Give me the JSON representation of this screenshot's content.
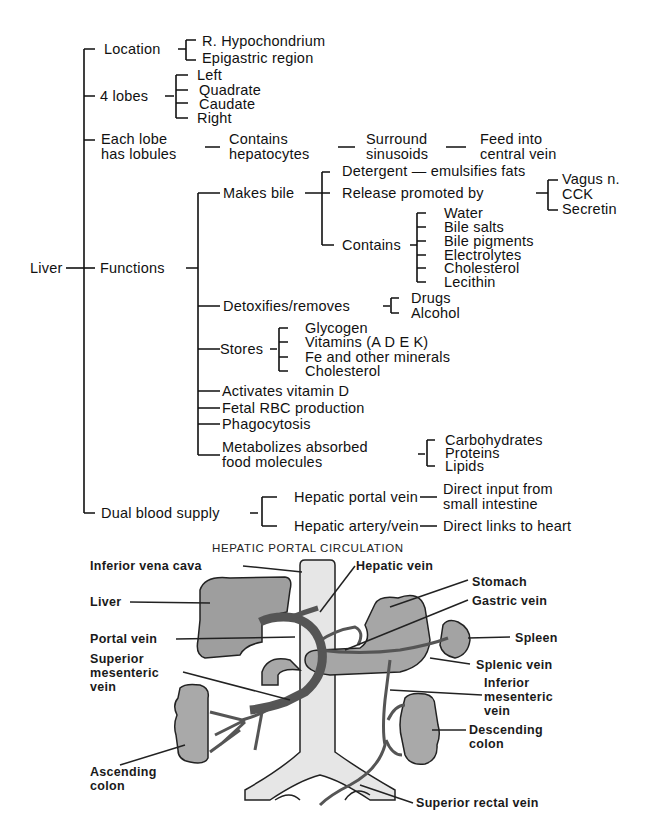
{
  "concept_map": {
    "root": "Liver",
    "branches": {
      "location": {
        "label": "Location",
        "children": [
          "R. Hypochondrium",
          "Epigastric region"
        ]
      },
      "lobes": {
        "label": "4 lobes",
        "children": [
          "Left",
          "Quadrate",
          "Caudate",
          "Right"
        ]
      },
      "lobules": {
        "label_line1": "Each lobe",
        "label_line2": "has lobules",
        "chain": [
          {
            "line1": "Contains",
            "line2": "hepatocytes"
          },
          {
            "line1": "Surround",
            "line2": "sinusoids"
          },
          {
            "line1": "Feed into",
            "line2": "central vein"
          }
        ]
      },
      "functions": {
        "label": "Functions",
        "makes_bile": {
          "label": "Makes bile",
          "detergent": "Detergent — emulsifies fats",
          "release": {
            "label": "Release promoted by",
            "children": [
              "Vagus n.",
              "CCK",
              "Secretin"
            ]
          },
          "contains": {
            "label": "Contains",
            "children": [
              "Water",
              "Bile salts",
              "Bile pigments",
              "Electrolytes",
              "Cholesterol",
              "Lecithin"
            ]
          }
        },
        "detox": {
          "label": "Detoxifies/removes",
          "children": [
            "Drugs",
            "Alcohol"
          ]
        },
        "stores": {
          "label": "Stores",
          "children": [
            "Glycogen",
            "Vitamins (A D E K)",
            "Fe and other minerals",
            "Cholesterol"
          ]
        },
        "activates": "Activates vitamin D",
        "fetal": "Fetal RBC production",
        "phago": "Phagocytosis",
        "metabolizes": {
          "label_line1": "Metabolizes absorbed",
          "label_line2": "food molecules",
          "children": [
            "Carbohydrates",
            "Proteins",
            "Lipids"
          ]
        }
      },
      "blood": {
        "label": "Dual blood supply",
        "portal": {
          "label": "Hepatic portal vein",
          "desc_line1": "Direct input from",
          "desc_line2": "small intestine"
        },
        "artery": {
          "label": "Hepatic artery/vein",
          "desc": "Direct links to heart"
        }
      }
    }
  },
  "illustration": {
    "title": "HEPATIC PORTAL CIRCULATION",
    "labels": {
      "ivc": "Inferior vena cava",
      "hepatic_vein": "Hepatic vein",
      "stomach": "Stomach",
      "gastric_vein": "Gastric vein",
      "liver": "Liver",
      "portal_vein": "Portal vein",
      "spleen": "Spleen",
      "splenic_vein": "Splenic vein",
      "sup_mes_1": "Superior",
      "sup_mes_2": "mesenteric",
      "sup_mes_3": "vein",
      "inf_mes_1": "Inferior",
      "inf_mes_2": "mesenteric",
      "inf_mes_3": "vein",
      "desc_colon_1": "Descending",
      "desc_colon_2": "colon",
      "asc_colon_1": "Ascending",
      "asc_colon_2": "colon",
      "sup_rectal": "Superior rectal vein"
    }
  }
}
